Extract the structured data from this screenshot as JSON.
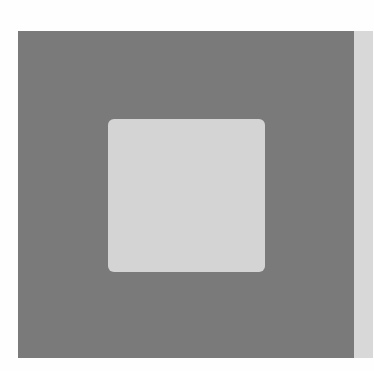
{
  "figure": {
    "outer_square": {
      "color": "#7a7a7a"
    },
    "inner_square": {
      "color": "#d4d4d4"
    },
    "side_strip": {
      "color": "#d8d8d8"
    },
    "background": "#fefefe"
  }
}
